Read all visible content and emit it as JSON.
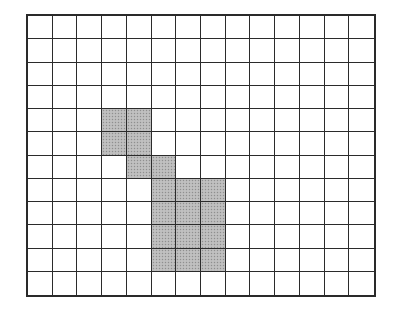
{
  "diagram": {
    "type": "grid",
    "rows": 12,
    "cols": 14,
    "colors": {
      "line": "#2b2b2b",
      "border": "#2a2a2a",
      "empty": "#ffffff",
      "shaded": "#b9b9b9"
    },
    "shaded_cells": [
      [
        4,
        3
      ],
      [
        4,
        4
      ],
      [
        5,
        3
      ],
      [
        5,
        4
      ],
      [
        6,
        4
      ],
      [
        6,
        5
      ],
      [
        7,
        5
      ],
      [
        7,
        6
      ],
      [
        7,
        7
      ],
      [
        8,
        5
      ],
      [
        8,
        6
      ],
      [
        8,
        7
      ],
      [
        9,
        5
      ],
      [
        9,
        6
      ],
      [
        9,
        7
      ],
      [
        10,
        5
      ],
      [
        10,
        6
      ],
      [
        10,
        7
      ]
    ]
  }
}
